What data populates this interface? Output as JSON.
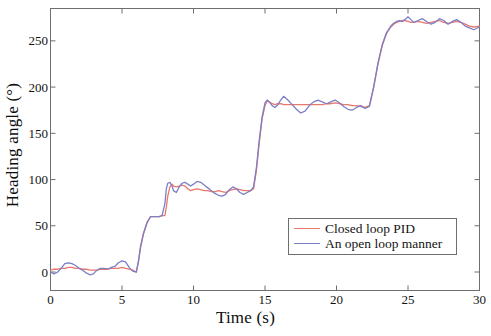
{
  "chart_data": {
    "type": "line",
    "title": "",
    "xlabel": "Time (s)",
    "ylabel": "Heading angle (°)",
    "xlim": [
      0,
      30
    ],
    "ylim": [
      -20,
      285
    ],
    "grid": false,
    "legend_position": "lower-right-inside",
    "xticks": [
      0,
      5,
      10,
      15,
      20,
      25,
      30
    ],
    "xtick_labels": [
      "0",
      "5",
      "10",
      "15",
      "20",
      "25",
      "30"
    ],
    "yticks": [
      0,
      50,
      100,
      150,
      200,
      250
    ],
    "ytick_labels": [
      "0",
      "50",
      "100",
      "150",
      "200",
      "250"
    ],
    "colors": {
      "closed_loop_pid": "#E8776C",
      "open_loop_manner": "#7B7FC6",
      "axis": "#6e6e6e",
      "text": "#121212",
      "background": "#ffffff"
    },
    "series": [
      {
        "name": "Closed loop PID",
        "color": "#E8776C",
        "x": [
          0.0,
          0.25,
          0.5,
          0.75,
          1.0,
          1.25,
          1.5,
          1.75,
          2.0,
          2.25,
          2.5,
          2.75,
          3.0,
          3.25,
          3.5,
          3.75,
          4.0,
          4.25,
          4.5,
          4.75,
          5.0,
          5.25,
          5.5,
          5.75,
          6.0,
          6.15,
          6.3,
          6.5,
          6.75,
          7.0,
          7.1,
          7.2,
          7.4,
          7.6,
          7.8,
          8.0,
          8.1,
          8.2,
          8.35,
          8.5,
          8.6,
          8.8,
          9.0,
          9.2,
          9.4,
          9.6,
          9.8,
          10.0,
          10.25,
          10.5,
          10.75,
          11.0,
          11.25,
          11.5,
          11.75,
          12.0,
          12.25,
          12.5,
          12.75,
          13.0,
          13.25,
          13.5,
          13.75,
          14.0,
          14.2,
          14.4,
          14.6,
          14.8,
          15.0,
          15.15,
          15.3,
          15.5,
          15.7,
          15.9,
          16.1,
          16.3,
          16.6,
          16.9,
          17.2,
          17.5,
          17.8,
          18.1,
          18.4,
          18.7,
          19.0,
          19.3,
          19.6,
          19.9,
          20.2,
          20.5,
          20.8,
          21.1,
          21.4,
          21.7,
          22.0,
          22.3,
          22.6,
          22.9,
          23.2,
          23.5,
          23.8,
          24.0,
          24.2,
          24.4,
          24.6,
          24.8,
          25.0,
          25.2,
          25.4,
          25.7,
          26.0,
          26.3,
          26.6,
          26.9,
          27.2,
          27.5,
          27.8,
          28.1,
          28.4,
          28.7,
          29.0,
          29.3,
          29.6,
          30.0
        ],
        "y": [
          2,
          3,
          3,
          4,
          4,
          5,
          5,
          4,
          4,
          3,
          3,
          2,
          2,
          2,
          3,
          3,
          3,
          4,
          4,
          4,
          5,
          4,
          3,
          2,
          0,
          12,
          28,
          42,
          54,
          60,
          60,
          60,
          60,
          60,
          61,
          61,
          70,
          82,
          92,
          95,
          93,
          92,
          93,
          94,
          93,
          90,
          88,
          89,
          90,
          89,
          88,
          88,
          87,
          87,
          88,
          87,
          86,
          88,
          89,
          90,
          89,
          88,
          88,
          88,
          90,
          110,
          140,
          166,
          180,
          185,
          184,
          182,
          181,
          182,
          182,
          181,
          181,
          181,
          181,
          181,
          181,
          181,
          181,
          181,
          181,
          182,
          182,
          183,
          182,
          181,
          181,
          180,
          180,
          179,
          178,
          180,
          200,
          225,
          245,
          258,
          265,
          268,
          270,
          271,
          272,
          272,
          271,
          270,
          270,
          271,
          270,
          269,
          270,
          271,
          272,
          270,
          269,
          270,
          271,
          270,
          268,
          266,
          265,
          266
        ]
      },
      {
        "name": "An open loop manner",
        "color": "#7B7FC6",
        "x": [
          0.0,
          0.25,
          0.5,
          0.75,
          1.0,
          1.25,
          1.5,
          1.75,
          2.0,
          2.25,
          2.5,
          2.75,
          3.0,
          3.25,
          3.5,
          3.75,
          4.0,
          4.25,
          4.5,
          4.75,
          5.0,
          5.25,
          5.5,
          5.75,
          6.0,
          6.15,
          6.3,
          6.5,
          6.75,
          7.0,
          7.1,
          7.2,
          7.4,
          7.6,
          7.8,
          8.0,
          8.1,
          8.2,
          8.35,
          8.5,
          8.6,
          8.8,
          9.0,
          9.2,
          9.4,
          9.6,
          9.8,
          10.0,
          10.25,
          10.5,
          10.75,
          11.0,
          11.25,
          11.5,
          11.75,
          12.0,
          12.25,
          12.5,
          12.75,
          13.0,
          13.25,
          13.5,
          13.75,
          14.0,
          14.2,
          14.4,
          14.6,
          14.8,
          15.0,
          15.15,
          15.3,
          15.5,
          15.7,
          15.9,
          16.1,
          16.3,
          16.6,
          16.9,
          17.2,
          17.5,
          17.8,
          18.1,
          18.4,
          18.7,
          19.0,
          19.3,
          19.6,
          19.9,
          20.2,
          20.5,
          20.8,
          21.1,
          21.4,
          21.7,
          22.0,
          22.3,
          22.6,
          22.9,
          23.2,
          23.5,
          23.8,
          24.0,
          24.2,
          24.4,
          24.6,
          24.8,
          25.0,
          25.2,
          25.4,
          25.7,
          26.0,
          26.3,
          26.6,
          26.9,
          27.2,
          27.5,
          27.8,
          28.1,
          28.4,
          28.7,
          29.0,
          29.3,
          29.6,
          30.0
        ],
        "y": [
          0,
          -2,
          0,
          4,
          9,
          10,
          9,
          7,
          4,
          2,
          -1,
          -3,
          -2,
          2,
          4,
          4,
          3,
          5,
          6,
          10,
          12,
          11,
          5,
          1,
          0,
          11,
          27,
          41,
          53,
          60,
          60,
          60,
          60,
          60,
          61,
          74,
          90,
          96,
          97,
          93,
          88,
          86,
          92,
          96,
          97,
          95,
          93,
          95,
          98,
          97,
          94,
          91,
          88,
          85,
          83,
          82,
          84,
          89,
          92,
          90,
          86,
          84,
          86,
          88,
          92,
          113,
          143,
          168,
          183,
          186,
          184,
          180,
          178,
          181,
          186,
          190,
          186,
          181,
          176,
          172,
          174,
          180,
          184,
          186,
          184,
          182,
          184,
          186,
          183,
          179,
          176,
          175,
          178,
          180,
          177,
          179,
          200,
          226,
          246,
          259,
          266,
          269,
          271,
          272,
          271,
          273,
          276,
          273,
          270,
          272,
          274,
          271,
          268,
          270,
          274,
          272,
          268,
          271,
          273,
          270,
          266,
          264,
          262,
          265
        ]
      }
    ]
  },
  "legend": {
    "items": [
      {
        "label": "Closed loop PID",
        "color": "#E8776C"
      },
      {
        "label": "An open loop manner",
        "color": "#7B7FC6"
      }
    ]
  },
  "axes": {
    "x_label": "Time (s)",
    "y_label": "Heading angle (°)"
  }
}
